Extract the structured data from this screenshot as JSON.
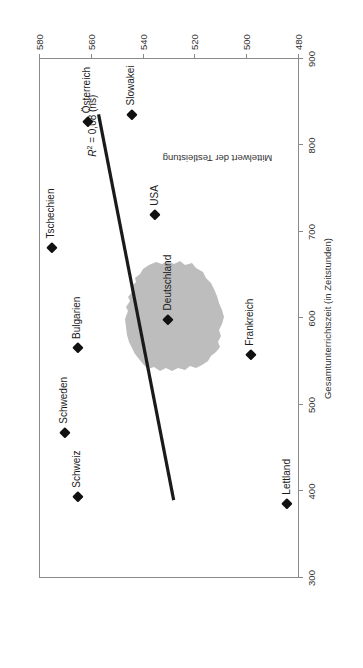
{
  "figure": {
    "cropped_running_title": "Abbildung ... Zusammenhang ...",
    "r2_annotation": {
      "symbol": "R",
      "exponent": "2",
      "text": " = 0,08 (ns)"
    },
    "germany_overlay": "deutschland-silhouette"
  },
  "chart_data": {
    "type": "scatter",
    "title": "",
    "xlabel": "Gesamtunterrichtszeit (in Zeitstunden)",
    "ylabel": "Mittelwert der Testleistung",
    "xlim": [
      300,
      900
    ],
    "ylim": [
      480,
      580
    ],
    "xticks": [
      300,
      400,
      500,
      600,
      700,
      800,
      900
    ],
    "yticks": [
      480,
      500,
      520,
      540,
      560,
      580
    ],
    "grid": false,
    "legend": null,
    "annotations": [
      "R² = 0,08 (ns)"
    ],
    "points": [
      {
        "label": "Österreich",
        "x": 827,
        "y": 561
      },
      {
        "label": "Slowakei",
        "x": 836,
        "y": 544
      },
      {
        "label": "Tschechien",
        "x": 682,
        "y": 575
      },
      {
        "label": "USA",
        "x": 720,
        "y": 535
      },
      {
        "label": "Bulgarien",
        "x": 566,
        "y": 565
      },
      {
        "label": "Schweden",
        "x": 468,
        "y": 570
      },
      {
        "label": "Schweiz",
        "x": 394,
        "y": 565
      },
      {
        "label": "Deutschland",
        "x": 599,
        "y": 530
      },
      {
        "label": "Frankreich",
        "x": 558,
        "y": 498
      },
      {
        "label": "Lettland",
        "x": 386,
        "y": 484
      }
    ],
    "trendline": {
      "from": {
        "x": 390,
        "y": 528
      },
      "to": {
        "x": 836,
        "y": 557
      }
    }
  },
  "colors": {
    "marker": "#111111",
    "trendline": "#1a1a1a",
    "axis": "#8a8a8a",
    "germany_fill": "#bdbdbd",
    "background": "#ffffff"
  }
}
